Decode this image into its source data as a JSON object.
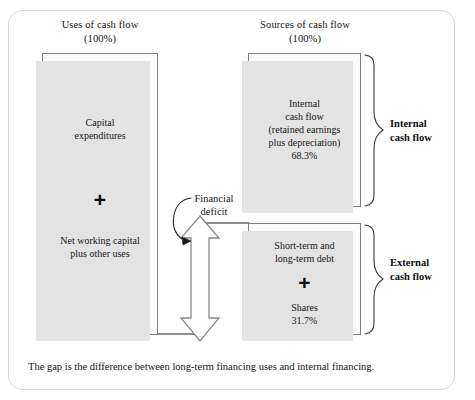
{
  "diagram": {
    "columns": {
      "uses": {
        "title": "Uses of cash flow",
        "subtitle": "(100%)"
      },
      "sources": {
        "title": "Sources of cash flow",
        "subtitle": "(100%)"
      }
    },
    "uses_boxes": {
      "capital": {
        "line1": "Capital",
        "line2": "expenditures"
      },
      "plus_sign": "+",
      "nwc": {
        "line1": "Net working capital",
        "line2": "plus other uses"
      }
    },
    "sources_boxes": {
      "internal": {
        "line1": "Internal",
        "line2": "cash flow",
        "line3": "(retained earnings",
        "line4": "plus depreciation)",
        "percent": "68.3%"
      },
      "external": {
        "line1": "Short-term and",
        "line2": "long-term debt",
        "plus_sign": "+",
        "line3": "Shares",
        "percent": "31.7%"
      }
    },
    "group_labels": {
      "internal": {
        "line1": "Internal",
        "line2": "cash flow"
      },
      "external": {
        "line1": "External",
        "line2": "cash flow"
      }
    },
    "deficit": {
      "line1": "Financial",
      "line2": "deficit"
    },
    "caption": "The gap is the difference between long-term financing uses and internal financing.",
    "colors": {
      "box_border": "#7e7e7e",
      "box_fill": "#fbfbfb",
      "shadow": "#e3e3e3",
      "frame_border": "#d8d8d8",
      "text": "#141414",
      "arrow_stroke": "#5a5a5a",
      "arrow_fill": "#ffffff"
    }
  }
}
